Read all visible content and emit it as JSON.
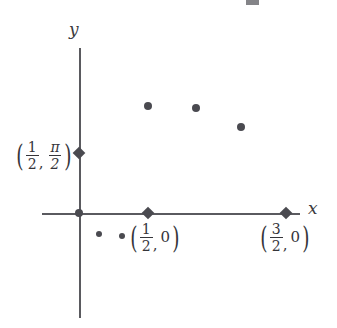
{
  "figure": {
    "type": "scatter",
    "background_color": "#ffffff",
    "ink_color": "#4a4a50",
    "axis_color": "#5a5a5f"
  },
  "axes": {
    "x_label": "x",
    "y_label": "y",
    "x_axis": {
      "start_px": 42,
      "end_px": 300,
      "y_px": 213
    },
    "y_axis": {
      "top_px": 48,
      "bottom_px": 318,
      "x_px": 79
    }
  },
  "origin": {
    "x_px": 79,
    "y_px": 213
  },
  "markers": [
    {
      "name": "y-axis-tick",
      "x_px": 79,
      "y_px": 153
    },
    {
      "name": "x-axis-tick-half",
      "x_px": 148,
      "y_px": 213
    },
    {
      "name": "x-axis-tick-three-halves",
      "x_px": 286,
      "y_px": 213
    }
  ],
  "labels": {
    "y_point": {
      "name": "half-pi-over-two",
      "text": "(1/2, pi/2)",
      "x_num": "1",
      "x_den": "2",
      "y_num": "π",
      "y_den": "2",
      "left_px": 14,
      "top_px": 140
    },
    "x_point_half": {
      "name": "half-zero",
      "text": "(1/2, 0)",
      "x_num": "1",
      "x_den": "2",
      "y_value": "0",
      "left_px": 128,
      "top_px": 222
    },
    "x_point_three_halves": {
      "name": "three-halves-zero",
      "text": "(3/2, 0)",
      "x_num": "3",
      "x_den": "2",
      "y_value": "0",
      "left_px": 258,
      "top_px": 222
    }
  },
  "chart_data": {
    "type": "scatter",
    "title": "",
    "xlabel": "x",
    "ylabel": "y",
    "grid": false,
    "legend": "none",
    "xlim": [
      -0.27,
      1.6
    ],
    "ylim": [
      -0.5,
      2.3
    ],
    "annotations": [
      {
        "label": "(1/2, pi/2)",
        "x": 0.5,
        "y": 1.5708,
        "axis": "y-axis-tick"
      },
      {
        "label": "(1/2, 0)",
        "x": 0.5,
        "y": 0
      },
      {
        "label": "(3/2, 0)",
        "x": 1.5,
        "y": 0
      }
    ],
    "series": [
      {
        "name": "upper-points",
        "marker_size_px": 8,
        "points_px": [
          {
            "x": 148,
            "y": 106
          },
          {
            "x": 196,
            "y": 108
          },
          {
            "x": 241,
            "y": 127
          }
        ],
        "x": [
          0.5,
          0.85,
          1.17
        ],
        "y": [
          1.78,
          1.74,
          1.49
        ]
      },
      {
        "name": "lower-points",
        "marker_size_px": 6,
        "points_px": [
          {
            "x": 99,
            "y": 234
          },
          {
            "x": 122,
            "y": 236
          }
        ],
        "x": [
          0.145,
          0.31
        ],
        "y": [
          -0.27,
          -0.3
        ]
      }
    ],
    "tick_markers_px": [
      {
        "x": 79,
        "y": 153
      },
      {
        "x": 148,
        "y": 213
      },
      {
        "x": 286,
        "y": 213
      }
    ]
  },
  "artifact": {
    "name": "cropped-text-fragment",
    "left_px": 246,
    "top_px": 0,
    "width_px": 13,
    "height_px": 5
  }
}
